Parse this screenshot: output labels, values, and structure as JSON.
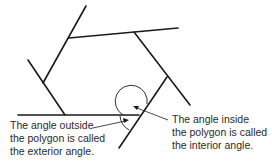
{
  "diagram": {
    "line_color": "#1a1a1a"
  },
  "labels": {
    "exterior": {
      "line1": "The angle outside",
      "line2": "the polygon is called",
      "line3": "the exterior angle."
    },
    "interior": {
      "line1": "The angle inside",
      "line2": "the polygon is called",
      "line3": "the interior angle."
    }
  }
}
